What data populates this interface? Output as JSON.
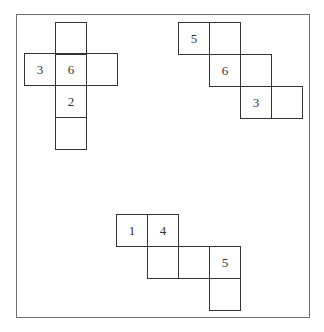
{
  "diagram": {
    "title": "",
    "cell_size": 31,
    "nets": [
      {
        "id": "net-a",
        "cells": [
          {
            "x": 55,
            "y": 22,
            "label": ""
          },
          {
            "x": 24,
            "y": 53,
            "label": "3"
          },
          {
            "x": 55,
            "y": 53,
            "label": "6"
          },
          {
            "x": 86,
            "y": 53,
            "label": ""
          },
          {
            "x": 55,
            "y": 85,
            "label": "2"
          },
          {
            "x": 55,
            "y": 117,
            "label": ""
          }
        ]
      },
      {
        "id": "net-b",
        "cells": [
          {
            "x": 178,
            "y": 22,
            "label": "5"
          },
          {
            "x": 209,
            "y": 22,
            "label": ""
          },
          {
            "x": 209,
            "y": 54,
            "label": "6"
          },
          {
            "x": 240,
            "y": 54,
            "label": ""
          },
          {
            "x": 240,
            "y": 86,
            "label": "3"
          },
          {
            "x": 271,
            "y": 86,
            "label": ""
          }
        ]
      },
      {
        "id": "net-c",
        "cells": [
          {
            "x": 116,
            "y": 214,
            "label": "1"
          },
          {
            "x": 147,
            "y": 214,
            "label": "4"
          },
          {
            "x": 147,
            "y": 246,
            "label": ""
          },
          {
            "x": 178,
            "y": 246,
            "label": ""
          },
          {
            "x": 209,
            "y": 246,
            "label": "5"
          },
          {
            "x": 209,
            "y": 278,
            "label": ""
          }
        ]
      }
    ]
  },
  "colors": {
    "frame": "#6e6e6e",
    "line": "#333333",
    "background": "#ffffff"
  }
}
